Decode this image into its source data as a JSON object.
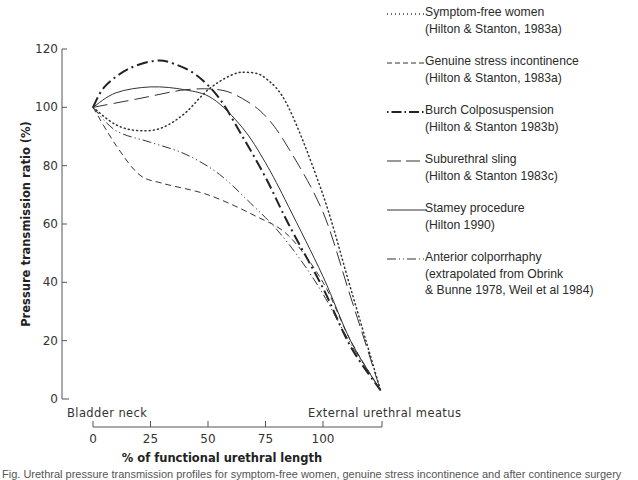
{
  "chart_data": {
    "type": "line",
    "title": "",
    "xlabel": "% of functional urethral length",
    "ylabel": "Pressure transmission ratio (%)",
    "xlim": [
      0,
      125
    ],
    "ylim": [
      0,
      120
    ],
    "x_ticks": [
      0,
      25,
      50,
      75,
      100
    ],
    "y_ticks": [
      0,
      20,
      40,
      60,
      80,
      100,
      120
    ],
    "x_anchor_labels": {
      "start": "Bladder neck",
      "end": "External urethral meatus"
    },
    "grid": false,
    "legend_position": "right",
    "series": [
      {
        "name": "Symptom-free women",
        "source": "(Hilton & Stanton, 1983a)",
        "style": "dotted",
        "points": [
          [
            0,
            100
          ],
          [
            10,
            94
          ],
          [
            20,
            92
          ],
          [
            30,
            93
          ],
          [
            40,
            98
          ],
          [
            50,
            106
          ],
          [
            60,
            111
          ],
          [
            67,
            112
          ],
          [
            75,
            110
          ],
          [
            85,
            100
          ],
          [
            100,
            70
          ],
          [
            112,
            38
          ],
          [
            125,
            3
          ]
        ]
      },
      {
        "name": "Genuine stress incontinence",
        "source": "(Hilton & Stanton, 1983a)",
        "style": "dashed",
        "points": [
          [
            0,
            100
          ],
          [
            10,
            87
          ],
          [
            20,
            77
          ],
          [
            30,
            74
          ],
          [
            50,
            70
          ],
          [
            70,
            63
          ],
          [
            85,
            56
          ],
          [
            100,
            40
          ],
          [
            112,
            20
          ],
          [
            125,
            3
          ]
        ]
      },
      {
        "name": "Burch Colposuspension",
        "source": "(Hilton & Stanton 1983b)",
        "style": "bold-dash-dot",
        "points": [
          [
            0,
            100
          ],
          [
            5,
            107
          ],
          [
            15,
            113
          ],
          [
            27,
            116
          ],
          [
            35,
            115
          ],
          [
            45,
            111
          ],
          [
            55,
            103
          ],
          [
            65,
            90
          ],
          [
            75,
            76
          ],
          [
            85,
            60
          ],
          [
            100,
            38
          ],
          [
            112,
            18
          ],
          [
            125,
            3
          ]
        ]
      },
      {
        "name": "Suburethral sling",
        "source": "(Hilton & Stanton 1983c)",
        "style": "long-dash",
        "points": [
          [
            0,
            100
          ],
          [
            20,
            103
          ],
          [
            40,
            106
          ],
          [
            55,
            106
          ],
          [
            65,
            103
          ],
          [
            75,
            97
          ],
          [
            85,
            86
          ],
          [
            100,
            64
          ],
          [
            112,
            35
          ],
          [
            125,
            3
          ]
        ]
      },
      {
        "name": "Stamey procedure",
        "source": "(Hilton 1990)",
        "style": "solid",
        "points": [
          [
            0,
            100
          ],
          [
            10,
            105
          ],
          [
            25,
            107
          ],
          [
            40,
            106
          ],
          [
            52,
            103
          ],
          [
            65,
            93
          ],
          [
            75,
            81
          ],
          [
            85,
            66
          ],
          [
            100,
            42
          ],
          [
            112,
            20
          ],
          [
            125,
            3
          ]
        ]
      },
      {
        "name": "Anterior colporrhaphy",
        "source": "(extrapolated from Obrink & Bunne 1978, Weil et al 1984)",
        "style": "dash-dot-dot",
        "points": [
          [
            0,
            100
          ],
          [
            10,
            92
          ],
          [
            25,
            88
          ],
          [
            40,
            84
          ],
          [
            55,
            77
          ],
          [
            70,
            66
          ],
          [
            80,
            58
          ],
          [
            90,
            48
          ],
          [
            100,
            36
          ],
          [
            112,
            19
          ],
          [
            125,
            3
          ]
        ]
      }
    ]
  },
  "axes": {
    "y_tick_labels": [
      "120",
      "100",
      "80",
      "60",
      "40",
      "20",
      "0"
    ],
    "x_tick_labels": [
      "0",
      "25",
      "50",
      "75",
      "100"
    ],
    "y_title": "Pressure transmission ratio (%)",
    "x_title": "% of functional urethral length",
    "start_label": "Bladder neck",
    "end_label": "External urethral meatus"
  },
  "legend": {
    "items": [
      {
        "line1": "Symptom-free women",
        "line2": "(Hilton & Stanton, 1983a)"
      },
      {
        "line1": "Genuine stress incontinence",
        "line2": "(Hilton & Stanton, 1983a)"
      },
      {
        "line1": "Burch Colposuspension",
        "line2": "(Hilton & Stanton 1983b)"
      },
      {
        "line1": "Suburethral sling",
        "line2": "(Hilton & Stanton 1983c)"
      },
      {
        "line1": "Stamey procedure",
        "line2": "(Hilton 1990)"
      },
      {
        "line1": "Anterior  colporrhaphy",
        "line2": "(extrapolated from Obrink",
        "line3": "& Bunne 1978, Weil et al 1984)"
      }
    ]
  },
  "caption": {
    "text": "Fig. Urethral pressure transmission profiles for symptom-free women, genuine stress incontinence and after continence surgery"
  },
  "colors": {
    "ink": "#2a2a2a",
    "background": "#ffffff"
  }
}
